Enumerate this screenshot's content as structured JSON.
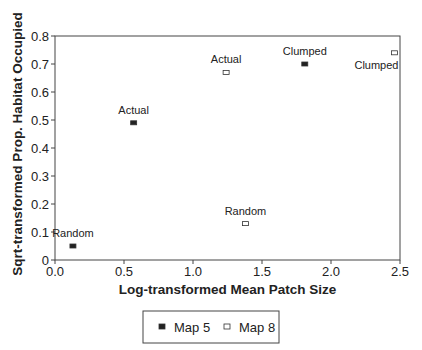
{
  "chart_data": {
    "type": "scatter",
    "title": "",
    "xlabel": "Log-transformed Mean Patch Size",
    "ylabel": "Sqrt-transformed Prop. Habitat Occupied",
    "xlim": [
      0,
      2.5
    ],
    "ylim": [
      0,
      0.8
    ],
    "xticks": [
      "0.0",
      "0.5",
      "1.0",
      "1.5",
      "2.0",
      "2.5"
    ],
    "yticks": [
      "0",
      "0.1",
      "0.2",
      "0.3",
      "0.4",
      "0.5",
      "0.6",
      "0.7",
      "0.8"
    ],
    "grid": false,
    "legend_position": "bottom",
    "series": [
      {
        "name": "Map 5",
        "marker": "filled-square",
        "color": "#000000",
        "points": [
          {
            "label": "Random",
            "x": 0.13,
            "y": 0.05
          },
          {
            "label": "Actual",
            "x": 0.57,
            "y": 0.49
          },
          {
            "label": "Clumped",
            "x": 1.81,
            "y": 0.7
          }
        ]
      },
      {
        "name": "Map 8",
        "marker": "open-square",
        "color": "#000000",
        "points": [
          {
            "label": "Actual",
            "x": 1.24,
            "y": 0.67
          },
          {
            "label": "Random",
            "x": 1.38,
            "y": 0.13
          },
          {
            "label": "Clumped",
            "x": 2.46,
            "y": 0.74
          }
        ]
      }
    ]
  }
}
